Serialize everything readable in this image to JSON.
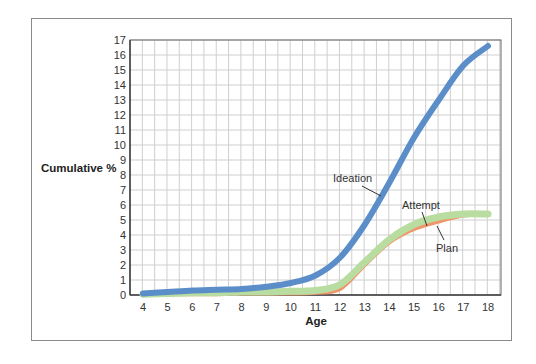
{
  "chart_data": {
    "type": "line",
    "title": "",
    "xlabel": "Age",
    "ylabel": "Cumulative %",
    "xlim": [
      4,
      18
    ],
    "ylim": [
      0,
      17
    ],
    "x_ticks": [
      4,
      5,
      6,
      7,
      8,
      9,
      10,
      11,
      12,
      13,
      14,
      15,
      16,
      17,
      18
    ],
    "y_ticks": [
      0,
      1,
      2,
      3,
      4,
      5,
      6,
      7,
      8,
      9,
      10,
      11,
      12,
      13,
      14,
      15,
      16,
      17
    ],
    "grid": true,
    "legend": "inline annotations",
    "x": [
      4,
      5,
      6,
      7,
      8,
      9,
      10,
      11,
      12,
      13,
      14,
      15,
      16,
      17,
      18
    ],
    "series": [
      {
        "name": "Ideation",
        "color": "#5b8ec9",
        "values": [
          0.1,
          0.2,
          0.3,
          0.35,
          0.4,
          0.55,
          0.8,
          1.3,
          2.5,
          4.7,
          7.5,
          10.5,
          13.0,
          15.3,
          16.6
        ]
      },
      {
        "name": "Attempt",
        "color": "#b9dca0",
        "values": [
          0.05,
          0.1,
          0.15,
          0.15,
          0.2,
          0.2,
          0.25,
          0.3,
          0.7,
          2.2,
          3.7,
          4.7,
          5.2,
          5.4,
          5.4
        ]
      },
      {
        "name": "Plan",
        "color": "#f0956a",
        "values": [
          0.0,
          0.05,
          0.05,
          0.05,
          0.1,
          0.1,
          0.1,
          0.15,
          0.4,
          2.0,
          3.5,
          4.4,
          4.9,
          5.3,
          5.4
        ]
      }
    ],
    "annotations": [
      {
        "label": "Ideation",
        "series": "Ideation"
      },
      {
        "label": "Attempt",
        "series": "Attempt"
      },
      {
        "label": "Plan",
        "series": "Plan"
      }
    ]
  }
}
